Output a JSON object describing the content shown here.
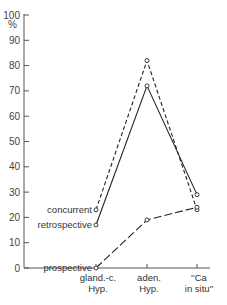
{
  "chart_data": {
    "type": "line",
    "title": "",
    "xlabel": "",
    "ylabel": "%",
    "ylim": [
      0,
      100
    ],
    "yticks": [
      0,
      10,
      20,
      30,
      40,
      50,
      60,
      70,
      80,
      90,
      100
    ],
    "grid": false,
    "legend_position": "inline labels at left of series start",
    "categories": [
      "gland.-c. Hyp.",
      "aden. Hyp.",
      "\"Ca in situ\""
    ],
    "category_lines": [
      [
        "gland.-c.",
        "Hyp."
      ],
      [
        "aden.",
        "Hyp."
      ],
      [
        "''Ca",
        "in situ''"
      ]
    ],
    "series": [
      {
        "name": "concurrent",
        "style": "short-dashed",
        "values": [
          23,
          82,
          23
        ]
      },
      {
        "name": "retrospective",
        "style": "solid",
        "values": [
          17,
          72,
          29
        ]
      },
      {
        "name": "prospective",
        "style": "long-dashed",
        "values": [
          0,
          19,
          24
        ]
      }
    ]
  },
  "axis": {
    "unit_label": "%"
  }
}
